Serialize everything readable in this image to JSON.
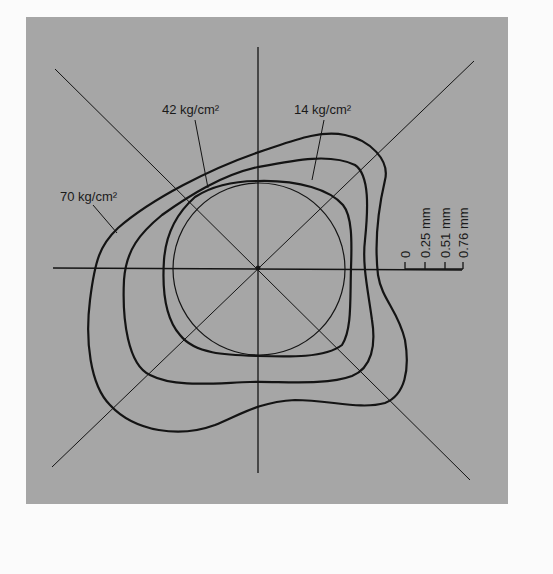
{
  "figure": {
    "background_color": "#a6a6a6",
    "line_color": "#141414",
    "labels": {
      "p70": "70 kg/cm²",
      "p42": "42 kg/cm²",
      "p14": "14 kg/cm²"
    },
    "scale": {
      "ticks": [
        "0",
        "0.25 mm",
        "0.51 mm",
        "0.76 mm"
      ]
    },
    "contours": [
      {
        "name": "reference-circle",
        "pressure": "0"
      },
      {
        "name": "contour-14",
        "pressure": "14 kg/cm²"
      },
      {
        "name": "contour-42",
        "pressure": "42 kg/cm²"
      },
      {
        "name": "contour-70",
        "pressure": "70 kg/cm²"
      }
    ]
  }
}
